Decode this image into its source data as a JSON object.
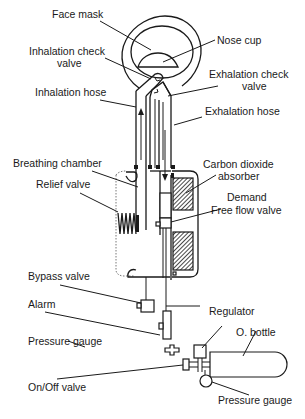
{
  "diagram": {
    "colors": {
      "line": "#1a1a1a",
      "background": "#ffffff"
    },
    "labels": {
      "face_mask": "Face mask",
      "nose_cup": "Nose cup",
      "inhalation_check_valve_1": "Inhalation check",
      "inhalation_check_valve_2": "valve",
      "exhalation_check_valve_1": "Exhalation check",
      "exhalation_check_valve_2": "valve",
      "inhalation_hose": "Inhalation hose",
      "exhalation_hose": "Exhalation hose",
      "breathing_chamber": "Breathing chamber",
      "carbon_dioxide_absorber_1": "Carbon dioxide",
      "carbon_dioxide_absorber_2": "absorber",
      "relief_valve": "Relief valve",
      "demand": "Demand",
      "free_flow_valve": "Free flow valve",
      "bypass_valve": "Bypass valve",
      "alarm": "Alarm",
      "regulator": "Regulator",
      "o_bottle": "O. bottle",
      "pressure_gauge_left": "Pressure gauge",
      "on_off_valve": "On/Off valve",
      "pressure_gauge_right": "Pressure gauge"
    },
    "flow_arrows": [
      {
        "hose": "inhalation",
        "direction": "up"
      },
      {
        "hose": "exhalation",
        "direction": "down"
      }
    ]
  }
}
